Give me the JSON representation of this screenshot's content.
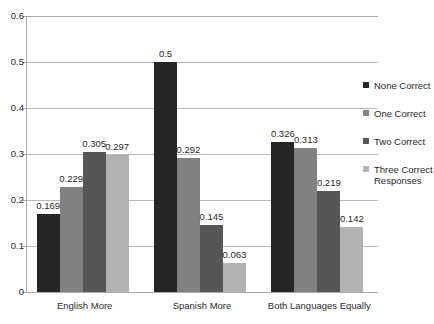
{
  "chart_data": {
    "type": "bar",
    "title": "",
    "subtitle": "",
    "xlabel": "",
    "ylabel": "",
    "categories": [
      "English More",
      "Spanish More",
      "Both Languages Equally"
    ],
    "series": [
      {
        "name": "None Correct",
        "color": "#262626",
        "values": [
          0.169,
          0.5,
          0.326
        ]
      },
      {
        "name": "One Correct",
        "color": "#818181",
        "values": [
          0.229,
          0.292,
          0.313
        ]
      },
      {
        "name": "Two Correct",
        "color": "#565656",
        "values": [
          0.305,
          0.145,
          0.219
        ]
      },
      {
        "name": "Three Correct\nResponses",
        "color": "#b2b2b2",
        "values": [
          0.297,
          0.063,
          0.142
        ]
      }
    ],
    "ylim": [
      0,
      0.6
    ],
    "yticks": [
      0,
      0.1,
      0.2,
      0.3,
      0.4,
      0.5,
      0.6
    ],
    "ytick_labels": [
      "0",
      "0.1",
      "0.2",
      "0.3",
      "0.4",
      "0.5",
      "0.6"
    ],
    "data_labels": [
      [
        "0.169",
        "0.229",
        "0.305",
        "0.297"
      ],
      [
        "0.5",
        "0.292",
        "0.145",
        "0.063"
      ],
      [
        "0.326",
        "0.313",
        "0.219",
        "0.142"
      ]
    ],
    "grid": true,
    "legend_position": "right",
    "legend_entries": [
      "None Correct",
      "One Correct",
      "Two Correct",
      "Three Correct Responses"
    ],
    "axis_color": "#a8a8a8",
    "grid_color": "#b9b9b9"
  }
}
